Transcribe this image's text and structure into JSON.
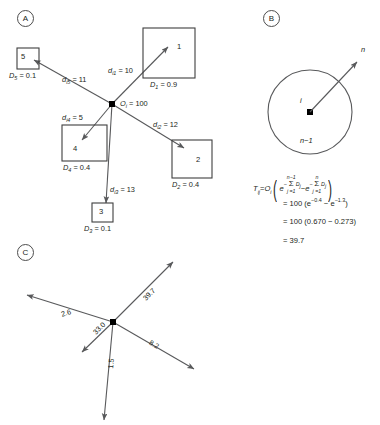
{
  "panels": {
    "a": {
      "tag": "A"
    },
    "b": {
      "tag": "B"
    },
    "c": {
      "tag": "C"
    }
  },
  "panel_a": {
    "origin": {
      "symbol": "O",
      "sub": "i",
      "value": "100",
      "label": "= 100"
    },
    "destinations": [
      {
        "id": "1",
        "number": "1",
        "distance_symbol": "d",
        "distance_sub": "i1",
        "distance_label": "= 10",
        "d_symbol": "D",
        "d_sub": "1",
        "d_label": "= 0.9"
      },
      {
        "id": "2",
        "number": "2",
        "distance_symbol": "d",
        "distance_sub": "i2",
        "distance_label": "= 12",
        "d_symbol": "D",
        "d_sub": "2",
        "d_label": "= 0.4"
      },
      {
        "id": "3",
        "number": "3",
        "distance_symbol": "d",
        "distance_sub": "i3",
        "distance_label": "= 13",
        "d_symbol": "D",
        "d_sub": "3",
        "d_label": "= 0.1"
      },
      {
        "id": "4",
        "number": "4",
        "distance_symbol": "d",
        "distance_sub": "i4",
        "distance_label": "= 5",
        "d_symbol": "D",
        "d_sub": "4",
        "d_label": "= 0.4"
      },
      {
        "id": "5",
        "number": "5",
        "distance_symbol": "d",
        "distance_sub": "i5",
        "distance_label": "= 11",
        "d_symbol": "D",
        "d_sub": "5",
        "d_label": "= 0.1"
      }
    ]
  },
  "panel_b": {
    "center_label": "i",
    "outer_label": "n",
    "ring_label": "n−1",
    "formula": {
      "lhs_symbol": "T",
      "lhs_sub": "ij",
      "equals": "=",
      "origin_symbol": "O",
      "origin_sub": "i",
      "exp_base_1": "e",
      "sum_top_1": "n−1",
      "sum_sign": "Σ",
      "sum_bot": "j =1",
      "sum_term": "D",
      "sum_term_sub": "j",
      "minus": "−",
      "exp_base_2": "e",
      "sum_top_2": "n",
      "neg": "−"
    },
    "steps": [
      {
        "text": "= 100 (e",
        "exp1": "−0.4",
        "mid": " − e",
        "exp2": "−1.3",
        "close": ")"
      },
      {
        "text": "= 100 (0.670 − 0.273)"
      },
      {
        "text": "= 39.7"
      }
    ]
  },
  "panel_c": {
    "flows": [
      {
        "label": "39.7"
      },
      {
        "label": "2.6"
      },
      {
        "label": "33.0"
      },
      {
        "label": "8.2"
      },
      {
        "label": "1.5"
      }
    ]
  },
  "colors": {
    "stroke": "#58595b",
    "box_stroke": "#3f3f3f",
    "text": "#231f20",
    "node": "#000000"
  }
}
